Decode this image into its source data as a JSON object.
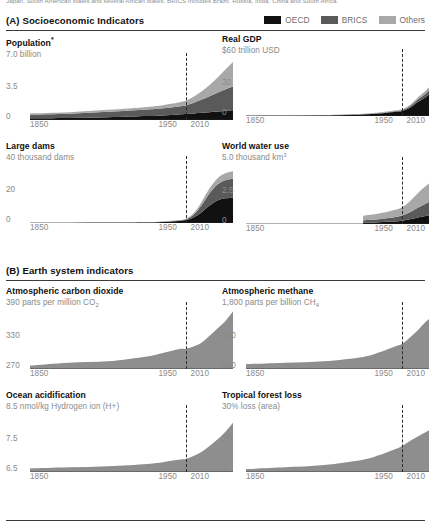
{
  "caption": {
    "cropped_text": "Japan, South American states and several African states. BRICS includes Brazil, Russia, India, China and South Africa."
  },
  "colors": {
    "oecd": "#111111",
    "brics": "#5a5a5a",
    "others": "#a8a8a8",
    "earth_area": "#8e8e8e",
    "rule": "#3b3b3b",
    "axis_text": "#8a8a8a",
    "title_text": "#0f0f0f"
  },
  "legend": {
    "items": [
      {
        "label": "OECD",
        "color": "#111111",
        "swatch_name": "legend-swatch-oecd"
      },
      {
        "label": "BRICS",
        "color": "#5a5a5a",
        "swatch_name": "legend-swatch-brics"
      },
      {
        "label": "Others",
        "color": "#a8a8a8",
        "swatch_name": "legend-swatch-others"
      }
    ]
  },
  "sections": [
    {
      "id": "A",
      "title": "(A) Socioeconomic Indicators"
    },
    {
      "id": "B",
      "title": "(B) Earth system indicators"
    }
  ],
  "xaxis": {
    "ticks": [
      "1850",
      "1950",
      "2010"
    ],
    "marker_year": "1950",
    "range": [
      1750,
      2010
    ]
  },
  "chart_data": [
    {
      "type": "area",
      "stacked": true,
      "title": "Population",
      "title_marker": "*",
      "subtitle": "7.0 billion",
      "ylabel": "billion",
      "ytick_top": "7.0 billion",
      "ytick_mid": "3.5",
      "ytick_bottom": "0",
      "ylim": [
        0,
        7.0
      ],
      "xlim": [
        1750,
        2010
      ],
      "xlabel": "",
      "grid": false,
      "legend_position": "top-right-shared",
      "marker_year": 1950,
      "x": [
        1750,
        1800,
        1850,
        1900,
        1920,
        1940,
        1950,
        1960,
        1970,
        1980,
        1990,
        2000,
        2010
      ],
      "series": [
        {
          "name": "OECD",
          "color": "#111111",
          "values": [
            0.2,
            0.24,
            0.33,
            0.47,
            0.55,
            0.66,
            0.71,
            0.79,
            0.87,
            0.94,
            1.02,
            1.1,
            1.18
          ]
        },
        {
          "name": "BRICS",
          "color": "#5a5a5a",
          "values": [
            0.44,
            0.52,
            0.66,
            0.8,
            0.87,
            0.98,
            1.08,
            1.3,
            1.6,
            1.92,
            2.26,
            2.58,
            2.85
          ]
        },
        {
          "name": "Others",
          "color": "#a8a8a8",
          "values": [
            0.16,
            0.19,
            0.24,
            0.31,
            0.36,
            0.46,
            0.56,
            0.75,
            1.0,
            1.36,
            1.82,
            2.37,
            2.97
          ]
        }
      ]
    },
    {
      "type": "area",
      "stacked": true,
      "title": "Real GDP",
      "subtitle": "$60 trillion USD",
      "ylabel": "trillion USD",
      "ytick_top": "$60 trillion USD",
      "ytick_mid": "30",
      "ytick_bottom": "0",
      "ylim": [
        0,
        60
      ],
      "xlim": [
        1750,
        2010
      ],
      "grid": false,
      "marker_year": 1950,
      "x": [
        1750,
        1800,
        1850,
        1900,
        1920,
        1940,
        1950,
        1960,
        1970,
        1980,
        1990,
        2000,
        2010
      ],
      "series": [
        {
          "name": "OECD",
          "color": "#111111",
          "values": [
            0.1,
            0.2,
            0.5,
            1.6,
            2.6,
            4.2,
            5.2,
            8.5,
            14.5,
            19.5,
            26.0,
            34.0,
            38.0
          ]
        },
        {
          "name": "BRICS",
          "color": "#5a5a5a",
          "values": [
            0.1,
            0.1,
            0.2,
            0.4,
            0.5,
            0.8,
            1.0,
            1.6,
            2.6,
            3.6,
            5.2,
            8.0,
            14.0
          ]
        },
        {
          "name": "Others",
          "color": "#a8a8a8",
          "values": [
            0.1,
            0.1,
            0.2,
            0.3,
            0.4,
            0.6,
            0.8,
            1.2,
            2.0,
            2.9,
            3.8,
            5.2,
            7.0
          ]
        }
      ]
    },
    {
      "type": "area",
      "stacked": true,
      "title": "Large dams",
      "subtitle": "40 thousand dams",
      "ylabel": "thousand dams",
      "ytick_top": "40 thousand dams",
      "ytick_mid": "20",
      "ytick_bottom": "0",
      "ylim": [
        0,
        40
      ],
      "xlim": [
        1750,
        2010
      ],
      "grid": false,
      "marker_year": 1950,
      "x": [
        1750,
        1800,
        1850,
        1900,
        1920,
        1940,
        1950,
        1960,
        1970,
        1980,
        1990,
        2000,
        2010
      ],
      "series": [
        {
          "name": "OECD",
          "color": "#111111",
          "values": [
            0.0,
            0.0,
            0.1,
            0.3,
            0.7,
            1.4,
            2.0,
            4.0,
            7.5,
            12.0,
            15.5,
            17.0,
            17.5
          ]
        },
        {
          "name": "BRICS",
          "color": "#5a5a5a",
          "values": [
            0.0,
            0.0,
            0.0,
            0.1,
            0.2,
            0.4,
            0.6,
            2.0,
            5.0,
            8.5,
            11.0,
            12.5,
            13.0
          ]
        },
        {
          "name": "Others",
          "color": "#a8a8a8",
          "values": [
            0.0,
            0.0,
            0.0,
            0.1,
            0.1,
            0.2,
            0.4,
            1.0,
            2.2,
            3.4,
            4.2,
            4.8,
            5.2
          ]
        }
      ]
    },
    {
      "type": "area",
      "stacked": true,
      "title": "World water use",
      "subtitle": "5.0 thousand km",
      "subtitle_sup": "3",
      "ylabel": "thousand km3",
      "ytick_top": "5.0 thousand km3",
      "ytick_mid": "2.5",
      "ytick_bottom": "0",
      "ylim": [
        0,
        5.0
      ],
      "xlim": [
        1750,
        2010
      ],
      "grid": false,
      "marker_year": 1950,
      "data_start_year": 1900,
      "x": [
        1900,
        1910,
        1920,
        1930,
        1940,
        1950,
        1960,
        1970,
        1980,
        1990,
        2000,
        2010
      ],
      "series": [
        {
          "name": "OECD",
          "color": "#111111",
          "values": [
            0.12,
            0.14,
            0.16,
            0.19,
            0.22,
            0.28,
            0.4,
            0.55,
            0.7,
            0.8,
            0.86,
            0.9
          ]
        },
        {
          "name": "BRICS",
          "color": "#5a5a5a",
          "values": [
            0.2,
            0.23,
            0.26,
            0.3,
            0.36,
            0.45,
            0.62,
            0.85,
            1.05,
            1.25,
            1.4,
            1.5
          ]
        },
        {
          "name": "Others",
          "color": "#a8a8a8",
          "values": [
            0.38,
            0.42,
            0.48,
            0.55,
            0.62,
            0.72,
            0.95,
            1.25,
            1.5,
            1.7,
            1.85,
            1.95
          ]
        }
      ]
    },
    {
      "type": "area",
      "stacked": false,
      "title": "Atmospheric carbon dioxide",
      "subtitle": "390 parts per million CO",
      "subtitle_sub": "2",
      "ylabel": "parts per million CO2",
      "ytick_top": "390 parts per million CO2",
      "ytick_mid": "330",
      "ytick_bottom": "270",
      "ylim": [
        270,
        390
      ],
      "xlim": [
        1750,
        2010
      ],
      "grid": false,
      "marker_year": 1950,
      "color": "#8e8e8e",
      "x": [
        1750,
        1800,
        1850,
        1900,
        1920,
        1940,
        1950,
        1960,
        1970,
        1980,
        1990,
        2000,
        2010
      ],
      "values": [
        277,
        283,
        286,
        296,
        303,
        311,
        312,
        317,
        325,
        339,
        354,
        369,
        389
      ]
    },
    {
      "type": "area",
      "stacked": false,
      "title": "Atmospheric methane",
      "subtitle": "1,800 parts per billion CH",
      "subtitle_sub": "4",
      "ylabel": "parts per billion CH4",
      "ytick_top": "1,800 parts per billion CH4",
      "ytick_mid": "900",
      "ytick_bottom": "600",
      "ylim": [
        600,
        1800
      ],
      "xlim": [
        1750,
        2010
      ],
      "grid": false,
      "marker_year": 1950,
      "color": "#8e8e8e",
      "x": [
        1750,
        1800,
        1850,
        1900,
        1920,
        1940,
        1950,
        1960,
        1970,
        1980,
        1990,
        2000,
        2010
      ],
      "values": [
        700,
        730,
        760,
        850,
        940,
        1060,
        1120,
        1250,
        1400,
        1570,
        1700,
        1760,
        1790
      ]
    },
    {
      "type": "area",
      "stacked": false,
      "title": "Ocean acidification",
      "subtitle": "8.5 nmol/kg Hydrogen ion (H+)",
      "ylabel": "nmol/kg Hydrogen ion (H+)",
      "ytick_top": "8.5 nmol/kg Hydrogen ion (H+)",
      "ytick_mid": "7.5",
      "ytick_bottom": "6.5",
      "ylim": [
        6.5,
        8.5
      ],
      "xlim": [
        1750,
        2010
      ],
      "grid": false,
      "marker_year": 1950,
      "color": "#8e8e8e",
      "x": [
        1750,
        1800,
        1850,
        1900,
        1920,
        1940,
        1950,
        1960,
        1970,
        1980,
        1990,
        2000,
        2010
      ],
      "values": [
        6.62,
        6.66,
        6.7,
        6.78,
        6.84,
        6.92,
        6.96,
        7.06,
        7.2,
        7.4,
        7.62,
        7.88,
        8.2
      ]
    },
    {
      "type": "area",
      "stacked": false,
      "title": "Tropical forest loss",
      "subtitle": "30% loss (area)",
      "ylabel": "% loss (area)",
      "ytick_top": "30% loss (area)",
      "ytick_mid": "15",
      "ytick_bottom": "0",
      "ylim": [
        0,
        30
      ],
      "xlim": [
        1750,
        2010
      ],
      "grid": false,
      "marker_year": 1950,
      "color": "#8e8e8e",
      "x": [
        1750,
        1800,
        1850,
        1900,
        1920,
        1940,
        1950,
        1960,
        1970,
        1980,
        1990,
        2000,
        2010
      ],
      "values": [
        1.5,
        2.4,
        3.6,
        6.4,
        8.6,
        11.6,
        13.4,
        16.0,
        18.4,
        20.6,
        22.8,
        25.0,
        27.6
      ]
    }
  ]
}
